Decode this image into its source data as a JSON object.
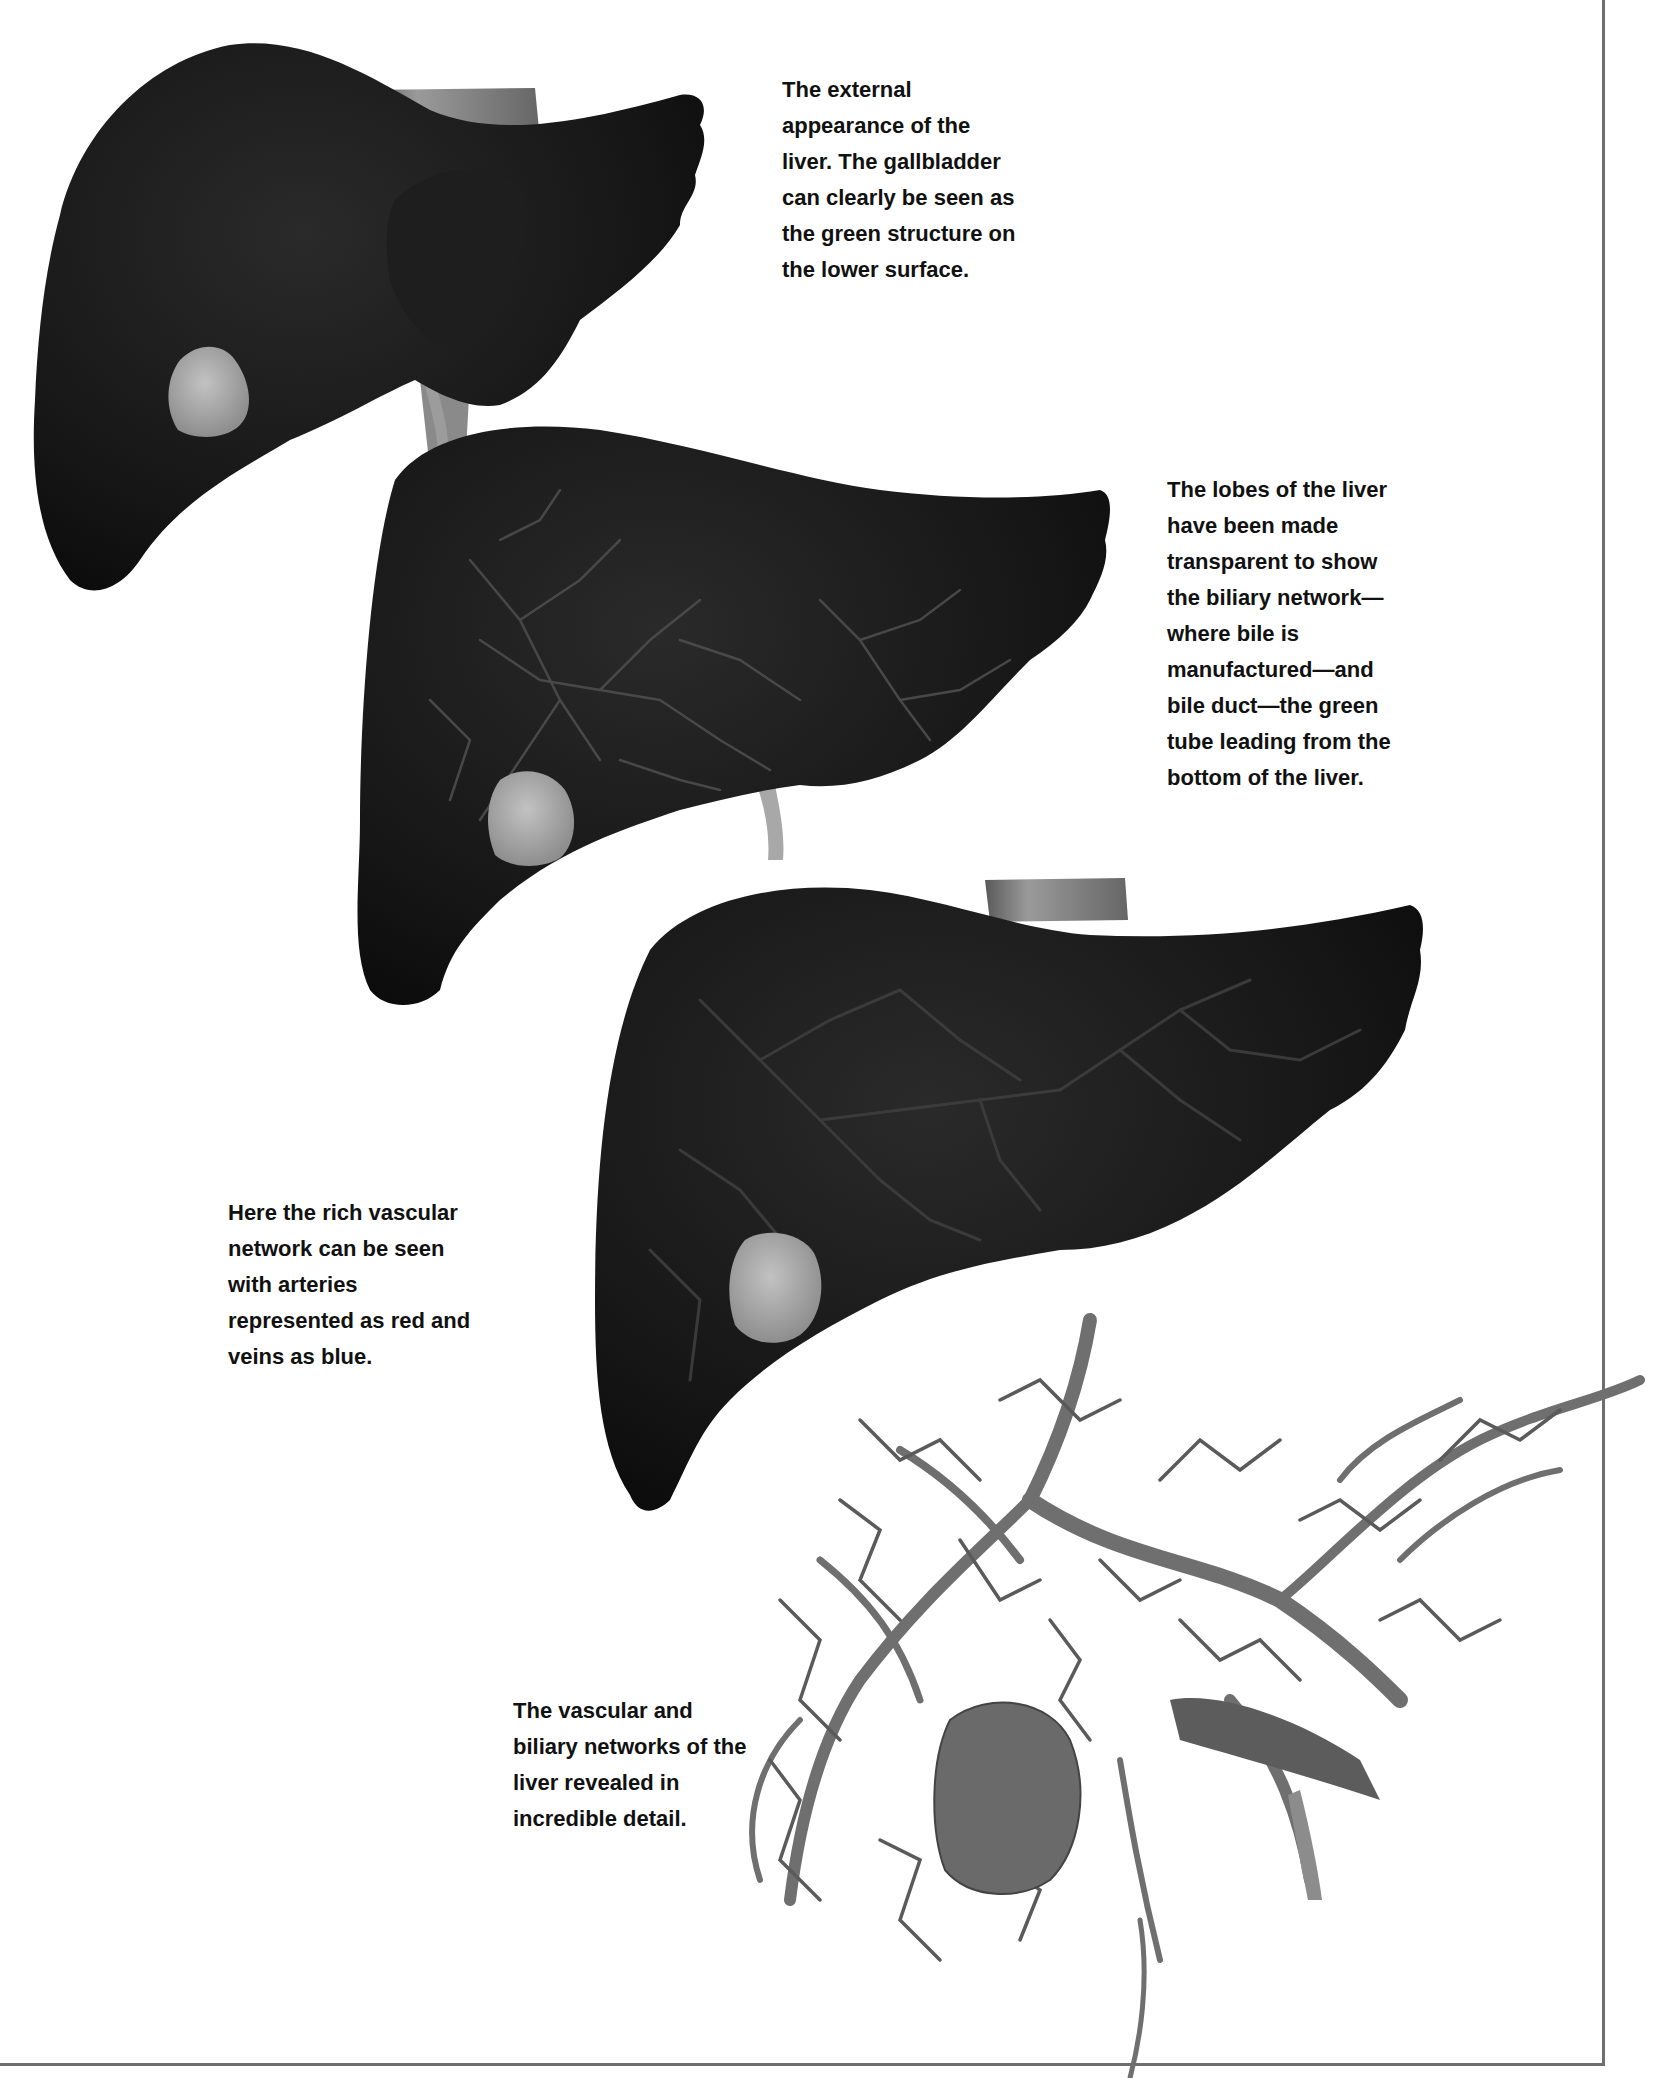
{
  "page": {
    "background": "#ffffff",
    "frame_color": "#6e6e6e",
    "top_cut_text": "........................................................................"
  },
  "figures": [
    {
      "id": "liver-external",
      "description": "External appearance of the liver with gallbladder",
      "caption_lines": [
        "The external",
        "appearance of the",
        "liver. The gallbladder",
        "can clearly be seen as",
        "the green structure on",
        "the lower surface."
      ]
    },
    {
      "id": "liver-biliary",
      "description": "Transparent lobes showing biliary network and bile duct",
      "caption_lines": [
        "The lobes of the liver",
        "have been made",
        "transparent to show",
        "the biliary network—",
        "where bile is",
        "manufactured—and",
        "bile duct—the green",
        "tube leading from the",
        "bottom of the liver."
      ]
    },
    {
      "id": "liver-vascular",
      "description": "Vascular network within the liver",
      "caption_lines": [
        "Here the rich vascular",
        "network can be seen",
        "with arteries",
        "represented as red and",
        "veins as blue."
      ]
    },
    {
      "id": "liver-networks",
      "description": "Vascular and biliary networks revealed",
      "caption_lines": [
        "The vascular and",
        "biliary networks of the",
        "liver revealed in",
        "incredible detail."
      ]
    }
  ],
  "colors": {
    "liver_dark": "#161616",
    "liver_edge": "#0e0e0e",
    "gallbladder": "#a9a9a9",
    "vessel": "#6f6f6f",
    "vessel_dark": "#4a4a4a",
    "vena_cava": "#7d7d7d",
    "caption_text": "#111111"
  }
}
